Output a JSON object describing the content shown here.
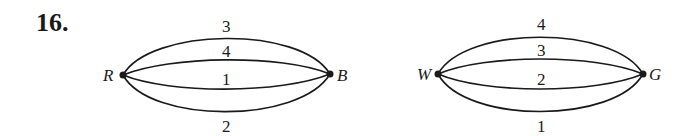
{
  "problem_number": "16.",
  "graphs": [
    {
      "vertices": [
        "R",
        "B"
      ],
      "edges": [
        {
          "label": "3",
          "position": "outer-top"
        },
        {
          "label": "4",
          "position": "inner-top"
        },
        {
          "label": "1",
          "position": "inner-bottom"
        },
        {
          "label": "2",
          "position": "outer-bottom"
        }
      ]
    },
    {
      "vertices": [
        "W",
        "G"
      ],
      "edges": [
        {
          "label": "4",
          "position": "outer-top"
        },
        {
          "label": "3",
          "position": "inner-top"
        },
        {
          "label": "2",
          "position": "inner-bottom"
        },
        {
          "label": "1",
          "position": "outer-bottom"
        }
      ]
    }
  ]
}
